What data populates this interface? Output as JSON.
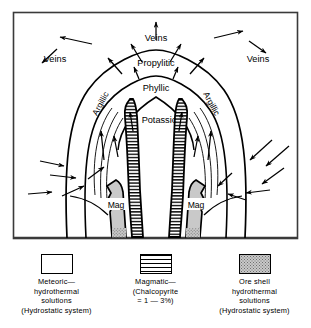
{
  "figure": {
    "type": "geological-cross-section-diagram",
    "title_visible": false
  },
  "diagram": {
    "alteration_zones": [
      {
        "id": "propylitic",
        "label": "Propylitic"
      },
      {
        "id": "phyllic",
        "label": "Phyllic"
      },
      {
        "id": "potassic",
        "label": "Potassic"
      },
      {
        "id": "argillic-left",
        "label": "Argillic"
      },
      {
        "id": "argillic-right",
        "label": "Argillic"
      }
    ],
    "vein_labels": [
      {
        "id": "veins-top",
        "label": "Veins"
      },
      {
        "id": "veins-left",
        "label": "Veins"
      },
      {
        "id": "veins-right",
        "label": "Veins"
      }
    ],
    "magma_labels": [
      {
        "id": "mag-left",
        "label": "Mag"
      },
      {
        "id": "mag-right",
        "label": "Mag"
      }
    ]
  },
  "legend": {
    "items": [
      {
        "id": "meteoric",
        "swatch": "open",
        "lines": [
          "Meteoric—",
          "hydrothermal",
          "solutions",
          "(Hydrostatic system)"
        ]
      },
      {
        "id": "magmatic",
        "swatch": "horizontal-hatch",
        "lines": [
          "Magmatic—",
          "(Chalcopyrite",
          "= 1 — 3%)"
        ]
      },
      {
        "id": "ore-shell",
        "swatch": "gray-stipple",
        "lines": [
          "Ore shell",
          "hydrothermal",
          "solutions",
          "(Hydrostatic system)"
        ]
      }
    ]
  },
  "colors": {
    "stroke": "#000000",
    "background": "#ffffff",
    "magma_fill": "#c9c9c9",
    "frame": "#3a3a3a"
  }
}
